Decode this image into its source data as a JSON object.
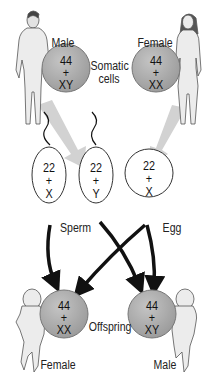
{
  "diagram": {
    "parents": {
      "male": {
        "label": "Male",
        "somatic": {
          "autosomes": "44",
          "plus": "+",
          "sex": "XY"
        }
      },
      "female": {
        "label": "Female",
        "somatic": {
          "autosomes": "44",
          "plus": "+",
          "sex": "XX"
        }
      },
      "somatic_label": "Somatic cells"
    },
    "gametes": {
      "sperm": [
        {
          "autosomes": "22",
          "plus": "+",
          "sex": "X"
        },
        {
          "autosomes": "22",
          "plus": "+",
          "sex": "Y"
        }
      ],
      "sperm_label": "Sperm",
      "egg": {
        "autosomes": "22",
        "plus": "+",
        "sex": "X"
      },
      "egg_label": "Egg"
    },
    "offspring": {
      "female": {
        "label": "Female",
        "cell": {
          "autosomes": "44",
          "plus": "+",
          "sex": "XX"
        }
      },
      "male": {
        "label": "Male",
        "cell": {
          "autosomes": "44",
          "plus": "+",
          "sex": "XY"
        }
      },
      "offspring_label": "Offspring"
    },
    "colors": {
      "cell_fill": "#a9a9a9",
      "arrow_gray": "#cfcfcf",
      "arrow_black": "#111111",
      "figure_fill": "#e9e9e9"
    }
  }
}
